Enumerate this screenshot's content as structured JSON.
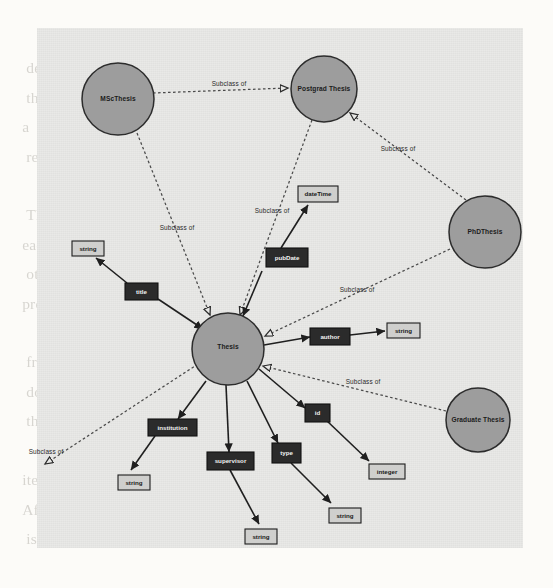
{
  "figure": {
    "kind": "ontology-graph",
    "background_text": "bleed-through text from reverse of scanned page",
    "legend_relation_label": "Subclass of",
    "colors": {
      "page": "#fcfbf8",
      "figure_panel": "#e9e9e7",
      "class_node_fill": "#9d9d9d",
      "class_node_stroke": "#2c2c2c",
      "property_box_fill": "#2b2b2b",
      "property_box_text": "#f2f2f2",
      "datatype_box_fill": "#cfcfcd",
      "datatype_box_text": "#191919",
      "solid_edge": "#1f1f1f",
      "dashed_edge": "#4a4a4a"
    },
    "class_nodes": [
      {
        "id": "msc",
        "label": "MScThesis",
        "cx": 118,
        "cy": 99,
        "r": 36
      },
      {
        "id": "postgrad",
        "label": "Postgrad Thesis",
        "cx": 324,
        "cy": 89,
        "r": 33
      },
      {
        "id": "phd",
        "label": "PhDThesis",
        "cx": 485,
        "cy": 232,
        "r": 36
      },
      {
        "id": "thesis",
        "label": "Thesis",
        "cx": 228,
        "cy": 349,
        "r": 36
      },
      {
        "id": "graduate",
        "label": "Graduate Thesis",
        "cx": 478,
        "cy": 420,
        "r": 32
      }
    ],
    "property_nodes": [
      {
        "id": "pubdate",
        "label": "pubDate",
        "x": 266,
        "y": 248,
        "w": 42,
        "h": 19
      },
      {
        "id": "title",
        "label": "title",
        "x": 125,
        "y": 283,
        "w": 33,
        "h": 17
      },
      {
        "id": "author",
        "label": "author",
        "x": 310,
        "y": 328,
        "w": 40,
        "h": 17
      },
      {
        "id": "institution",
        "label": "institution",
        "x": 148,
        "y": 419,
        "w": 49,
        "h": 17
      },
      {
        "id": "id",
        "label": "id",
        "x": 305,
        "y": 404,
        "w": 25,
        "h": 18
      },
      {
        "id": "supervisor",
        "label": "supervisor",
        "x": 207,
        "y": 452,
        "w": 47,
        "h": 18
      },
      {
        "id": "type",
        "label": "type",
        "x": 272,
        "y": 443,
        "w": 29,
        "h": 20
      }
    ],
    "datatype_nodes": [
      {
        "id": "dt_datetime",
        "label": "dateTime",
        "x": 298,
        "y": 186,
        "w": 40,
        "h": 16
      },
      {
        "id": "dt_string_1",
        "label": "string",
        "x": 72,
        "y": 241,
        "w": 32,
        "h": 15
      },
      {
        "id": "dt_string_2",
        "label": "string",
        "x": 387,
        "y": 323,
        "w": 33,
        "h": 15
      },
      {
        "id": "dt_string_3",
        "label": "string",
        "x": 118,
        "y": 475,
        "w": 32,
        "h": 15
      },
      {
        "id": "dt_integer",
        "label": "integer",
        "x": 369,
        "y": 464,
        "w": 36,
        "h": 15
      },
      {
        "id": "dt_string_4",
        "label": "string",
        "x": 329,
        "y": 508,
        "w": 32,
        "h": 15
      },
      {
        "id": "dt_string_5",
        "label": "string",
        "x": 245,
        "y": 529,
        "w": 32,
        "h": 15
      }
    ],
    "subclass_edges": [
      {
        "from": "msc",
        "to": "postgrad",
        "label": "Subclass of",
        "lx": 229,
        "ly": 84
      },
      {
        "from": "msc",
        "to": "thesis",
        "label": "Subclass of",
        "lx": 177,
        "ly": 228
      },
      {
        "from": "postgrad",
        "to": "thesis",
        "label": "Subclass of",
        "lx": 272,
        "ly": 211
      },
      {
        "from": "postgrad",
        "to": "phd",
        "label": "Subclass of",
        "lx": 398,
        "ly": 149
      },
      {
        "from": "phd",
        "to": "thesis",
        "label": "Subclass of",
        "lx": 357,
        "ly": 290
      },
      {
        "from": "graduate",
        "to": "thesis",
        "label": "Subclass of",
        "lx": 363,
        "ly": 382
      },
      {
        "from": "thesis",
        "to": "external",
        "label": "Subclass of",
        "lx": 46,
        "ly": 452
      }
    ],
    "property_edges": [
      {
        "from": "thesis",
        "to": "pubdate"
      },
      {
        "from": "pubdate",
        "to": "dt_datetime"
      },
      {
        "from": "thesis",
        "to": "title"
      },
      {
        "from": "title",
        "to": "dt_string_1"
      },
      {
        "from": "thesis",
        "to": "author"
      },
      {
        "from": "author",
        "to": "dt_string_2"
      },
      {
        "from": "thesis",
        "to": "institution"
      },
      {
        "from": "institution",
        "to": "dt_string_3"
      },
      {
        "from": "thesis",
        "to": "supervisor"
      },
      {
        "from": "supervisor",
        "to": "dt_string_5"
      },
      {
        "from": "thesis",
        "to": "type"
      },
      {
        "from": "type",
        "to": "dt_string_4"
      },
      {
        "from": "thesis",
        "to": "id"
      },
      {
        "from": "id",
        "to": "dt_integer"
      }
    ]
  },
  "ghost_text": "        the     ble    of    the    an     the\n   der  of    conc   of    the     onto  is\n   the    which     has   be   define   as\n  a    set   of    concepts    and    their\n   relations      in      a     domain      A\n\n   The    resulting     graph     shows    how\n  each   class   is    related    to    the\n   others      through      subclass      and\n  property  assertions  that  are  derived\n\n   from   the  raw   text   of   the   source\n   documents    and    later    refined    by\n   the    domain    expert     in     several\n\n  iterations   of   the   modelling   process\n  After  each  round   the  resulting   model\n   is  evaluated  against  the  requirements"
}
